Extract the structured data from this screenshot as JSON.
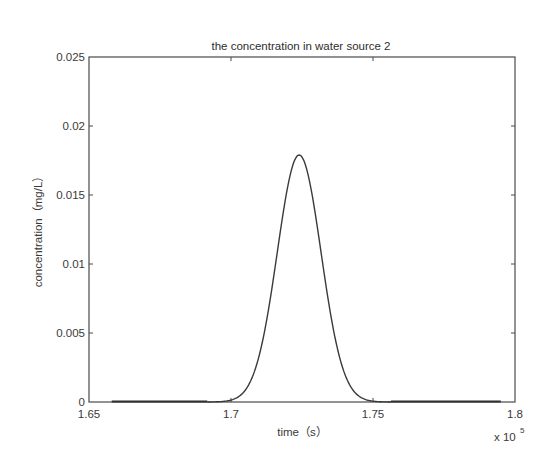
{
  "chart_data": {
    "type": "line",
    "title": "the concentration in water source 2",
    "xlabel": "time（s）",
    "ylabel": "concentration（mg/L）",
    "x_multiplier_label": "x 10",
    "x_multiplier_exponent": "5",
    "xlim": [
      1.65,
      1.8
    ],
    "ylim": [
      0,
      0.025
    ],
    "x_ticks": [
      1.65,
      1.7,
      1.75,
      1.8
    ],
    "x_tick_labels": [
      "1.65",
      "1.7",
      "1.75",
      "1.8"
    ],
    "y_ticks": [
      0,
      0.005,
      0.01,
      0.015,
      0.02,
      0.025
    ],
    "y_tick_labels": [
      "0",
      "0.005",
      "0.01",
      "0.015",
      "0.02",
      "0.025"
    ],
    "grid": false,
    "legend": null,
    "series": [
      {
        "name": "concentration",
        "shape": "gaussian pulse",
        "x_start": 1.658,
        "x_end": 1.795,
        "peak_x": 1.724,
        "peak_y": 0.0179,
        "sigma_x": 0.0077,
        "x": [
          1.658,
          1.69,
          1.7,
          1.705,
          1.71,
          1.715,
          1.72,
          1.724,
          1.728,
          1.733,
          1.738,
          1.743,
          1.748,
          1.758,
          1.795
        ],
        "y": [
          0,
          0.0001,
          0.0012,
          0.0031,
          0.0066,
          0.0112,
          0.0157,
          0.0179,
          0.0157,
          0.0112,
          0.0066,
          0.0031,
          0.0012,
          0.0001,
          0
        ]
      }
    ]
  },
  "colors": {
    "background": "#ffffff",
    "axes": "#4a4a4a",
    "line": "#3a3a3a",
    "text": "#3a3a3a"
  }
}
